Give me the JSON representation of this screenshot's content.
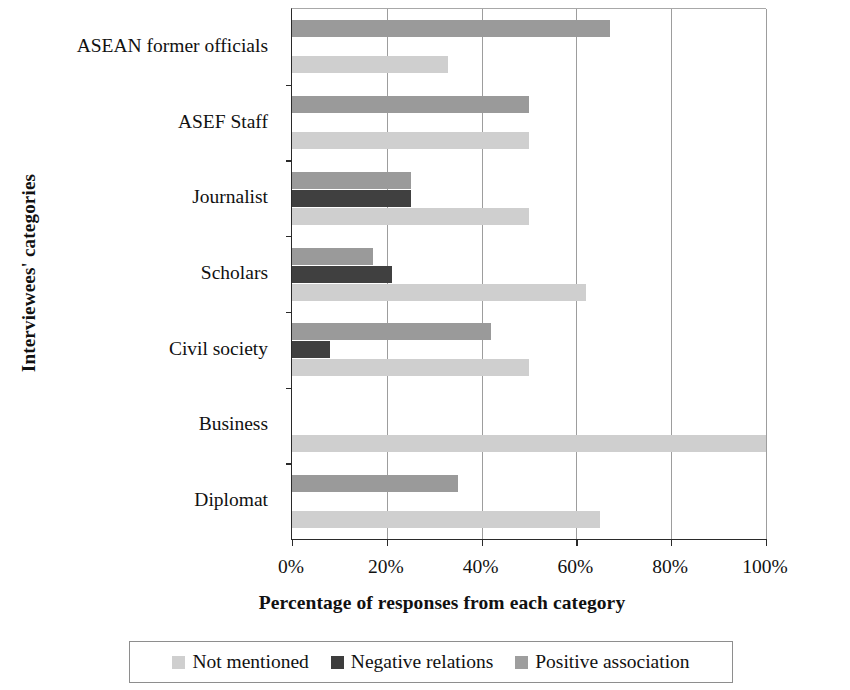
{
  "chart_data": {
    "type": "bar",
    "orientation": "horizontal",
    "title": "",
    "xlabel": "Percentage of responses from each category",
    "ylabel": "Interviewees' categories",
    "xlim": [
      0,
      100
    ],
    "xticks": [
      "0%",
      "20%",
      "40%",
      "60%",
      "80%",
      "100%"
    ],
    "xtick_values": [
      0,
      20,
      40,
      60,
      80,
      100
    ],
    "grid": true,
    "legend_position": "bottom",
    "categories": [
      "ASEAN former officials",
      "ASEF Staff",
      "Journalist",
      "Scholars",
      "Civil society",
      "Business",
      "Diplomat"
    ],
    "series": [
      {
        "name": "Positive association",
        "color": "#9a9a9a",
        "values": [
          67,
          50,
          25,
          17,
          42,
          0,
          35
        ]
      },
      {
        "name": "Negative relations",
        "color": "#404040",
        "values": [
          0,
          0,
          25,
          21,
          8,
          0,
          0
        ]
      },
      {
        "name": "Not mentioned",
        "color": "#cfcfcf",
        "values": [
          33,
          50,
          50,
          62,
          50,
          100,
          65
        ]
      }
    ],
    "legend": [
      {
        "label": "Not mentioned",
        "color": "#cfcfcf"
      },
      {
        "label": "Negative relations",
        "color": "#3d3d3d"
      },
      {
        "label": "Positive association",
        "color": "#9e9e9e"
      }
    ]
  }
}
